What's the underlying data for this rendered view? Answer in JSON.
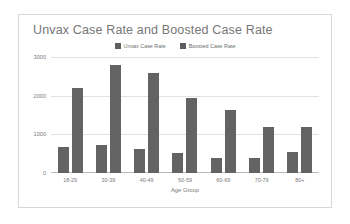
{
  "chart_data": {
    "type": "bar",
    "title": "Unvax Case Rate and Boosted Case Rate",
    "xlabel": "Age Group",
    "ylabel": "",
    "categories": [
      "18-29",
      "30-39",
      "40-49",
      "50-59",
      "60-69",
      "70-79",
      "80+"
    ],
    "series": [
      {
        "name": "Unvax Case Rate",
        "color": "#636363",
        "values": [
          660,
          720,
          630,
          510,
          390,
          385,
          545
        ]
      },
      {
        "name": "Boosted Case Rate",
        "color": "#636363",
        "values": [
          2200,
          2790,
          2580,
          1950,
          1620,
          1180,
          1190
        ]
      }
    ],
    "ylim": [
      0,
      3000
    ],
    "yticks": [
      0,
      1000,
      2000,
      3000
    ],
    "ytick_labels": [
      "0",
      "1000",
      "2000",
      "3000"
    ],
    "grid": true,
    "legend_position": "top-center"
  },
  "legend": {
    "items": [
      {
        "label": "Unvax Case Rate"
      },
      {
        "label": "Boosted Case Rate"
      }
    ]
  },
  "colors": {
    "bar": "#636363",
    "grid": "#e2e2e2",
    "axis": "#b9b9b9",
    "title_text": "#767676",
    "tick_text": "#797979",
    "figure_border": "#d8d8d8",
    "background": "#ffffff"
  }
}
